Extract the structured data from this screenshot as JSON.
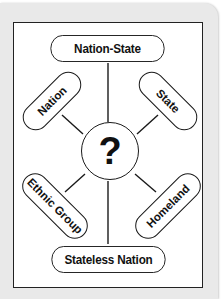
{
  "diagram": {
    "type": "concept-web",
    "center": {
      "label": "?"
    },
    "nodes": {
      "top": {
        "label": "Nation-State"
      },
      "upper_left": {
        "label": "Nation"
      },
      "upper_right": {
        "label": "State"
      },
      "lower_left": {
        "label": "Ethnic Group"
      },
      "lower_right": {
        "label": "Homeland"
      },
      "bottom": {
        "label": "Stateless Nation"
      }
    },
    "colors": {
      "frame_background": "#e9e9e9",
      "panel_background": "#ffffff",
      "stroke": "#1a1a1a",
      "text": "#111111"
    }
  }
}
